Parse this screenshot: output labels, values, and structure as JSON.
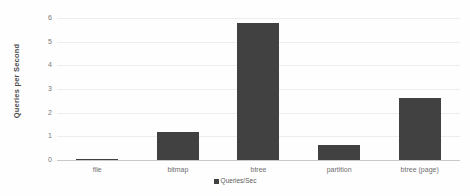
{
  "chart_data": {
    "type": "bar",
    "title": "",
    "subtitle": "",
    "xlabel": "",
    "ylabel": "Queries per Second",
    "categories": [
      "file",
      "bitmap",
      "btree",
      "partition",
      "btree (page)"
    ],
    "values": [
      0.05,
      1.2,
      5.8,
      0.65,
      2.6
    ],
    "series": [
      {
        "name": "Queries/Sec",
        "values": [
          0.05,
          1.2,
          5.8,
          0.65,
          2.6
        ]
      }
    ],
    "ylim": [
      0,
      6
    ],
    "y_ticks": [
      0,
      1,
      2,
      3,
      4,
      5,
      6
    ],
    "y_tick_labels": [
      "0",
      "1",
      "2",
      "3",
      "4",
      "5",
      "6"
    ],
    "grid": true,
    "legend_position": "bottom",
    "legend": [
      "Queries/Sec"
    ],
    "bar_color": "#414141",
    "grid_color": "#ededed",
    "background_color": "#fefefe"
  }
}
